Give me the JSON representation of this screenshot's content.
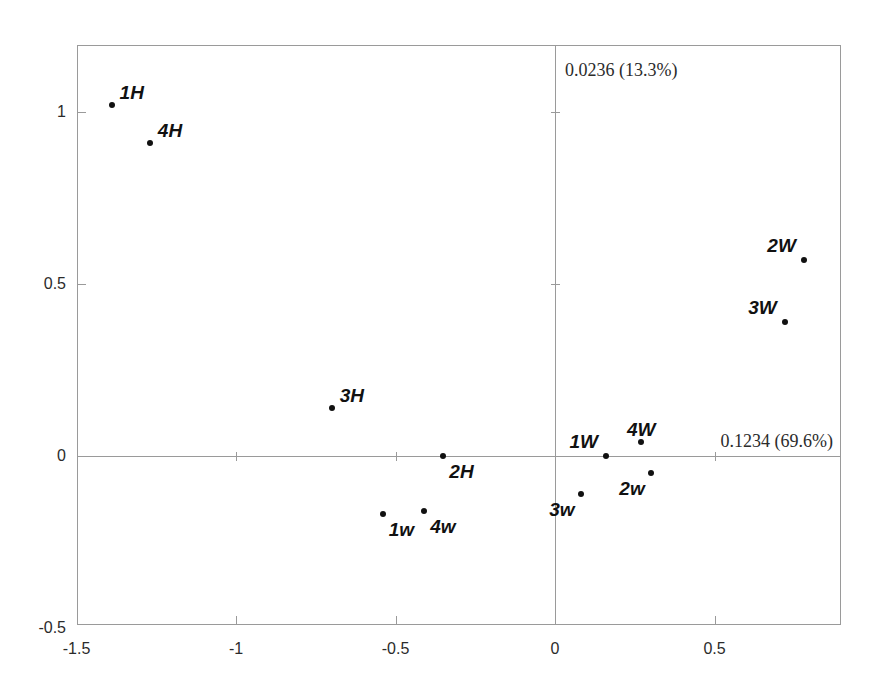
{
  "chart_data": {
    "type": "scatter",
    "title": "",
    "xlabel": "0.1234 (69.6%)",
    "ylabel": "0.0236 (13.3%)",
    "xlim": [
      -1.5,
      0.9
    ],
    "ylim": [
      -0.5,
      1.18
    ],
    "xticks": [
      -1.5,
      -1,
      -0.5,
      0,
      0.5
    ],
    "xtick_labels": [
      "-1.5",
      "-1",
      "-0.5",
      "0",
      "0.5"
    ],
    "yticks": [
      -0.5,
      0,
      0.5,
      1
    ],
    "ytick_labels": [
      "-0.5",
      "0",
      "0.5",
      "1"
    ],
    "grid": false,
    "legend": "none",
    "axis_lines_at_zero": true,
    "points": [
      {
        "label": "1H",
        "x": -1.39,
        "y": 1.02,
        "label_pos": "above-right"
      },
      {
        "label": "4H",
        "x": -1.27,
        "y": 0.91,
        "label_pos": "above-right"
      },
      {
        "label": "3H",
        "x": -0.7,
        "y": 0.14,
        "label_pos": "above-right"
      },
      {
        "label": "2H",
        "x": -0.35,
        "y": 0.0,
        "label_pos": "below-right"
      },
      {
        "label": "1w",
        "x": -0.54,
        "y": -0.17,
        "label_pos": "below-right"
      },
      {
        "label": "4w",
        "x": -0.41,
        "y": -0.16,
        "label_pos": "below-right"
      },
      {
        "label": "3w",
        "x": 0.08,
        "y": -0.11,
        "label_pos": "below-left"
      },
      {
        "label": "1W",
        "x": 0.16,
        "y": 0.0,
        "label_pos": "above-left"
      },
      {
        "label": "4W",
        "x": 0.27,
        "y": 0.04,
        "label_pos": "above-center"
      },
      {
        "label": "2w",
        "x": 0.3,
        "y": -0.05,
        "label_pos": "below-left"
      },
      {
        "label": "3W",
        "x": 0.72,
        "y": 0.39,
        "label_pos": "above-left"
      },
      {
        "label": "2W",
        "x": 0.78,
        "y": 0.57,
        "label_pos": "above-left"
      }
    ]
  }
}
